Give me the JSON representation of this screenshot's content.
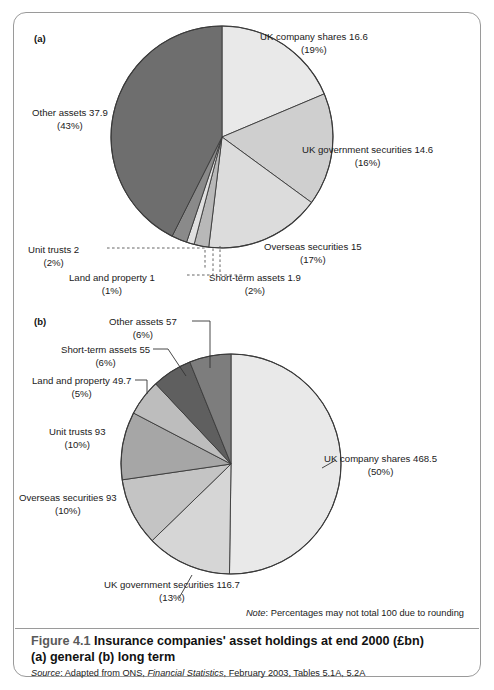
{
  "figure": {
    "panel_a_tag": "(a)",
    "panel_b_tag": "(b)",
    "note_word": "Note",
    "note_text": ": Percentages may not total 100 due to rounding",
    "caption_number": "Figure 4.1",
    "caption_title": "Insurance companies' asset holdings at end 2000 (£bn)",
    "caption_subtitle": "(a) general  (b) long term",
    "source_word": "Source",
    "source_text_1": ": Adapted from ONS, ",
    "source_publication": "Financial Statistics",
    "source_text_2": ", February 2003, Tables 5.1A, 5.2A"
  },
  "colors": {
    "shade_lightest": "#e9e9e9",
    "shade_light": "#dcdcdc",
    "shade_light_mid": "#cfcfcf",
    "shade_mid": "#b8b8b8",
    "shade_mid_dark": "#a6a6a6",
    "shade_dark": "#8a8a8a",
    "shade_darkest": "#6e6e6e",
    "outline": "#3a3a3a",
    "frame": "#9a9a9a",
    "text": "#1a1a1a"
  },
  "chart_data": [
    {
      "type": "pie",
      "id": "panel-a",
      "panel": "(a)",
      "title": "Insurance companies' asset holdings at end 2000 (£bn) (a) general",
      "unit": "£bn",
      "total": 89.0,
      "start_angle_deg": 0,
      "direction": "clockwise",
      "legend": "labels-with-leader-lines",
      "slices": [
        {
          "label": "UK company shares",
          "value": 16.6,
          "value_text": "16.6",
          "percent": 19,
          "percent_text": "(19%)",
          "color": "#e9e9e9"
        },
        {
          "label": "UK government securities",
          "value": 14.6,
          "value_text": "14.6",
          "percent": 16,
          "percent_text": "(16%)",
          "color": "#cfcfcf"
        },
        {
          "label": "Overseas securities",
          "value": 15,
          "value_text": "15",
          "percent": 17,
          "percent_text": "(17%)",
          "color": "#dcdcdc"
        },
        {
          "label": "Short-term assets",
          "value": 1.9,
          "value_text": "1.9",
          "percent": 2,
          "percent_text": "(2%)",
          "color": "#b8b8b8"
        },
        {
          "label": "Land and property",
          "value": 1,
          "value_text": "1",
          "percent": 1,
          "percent_text": "(1%)",
          "color": "#e0e0e0"
        },
        {
          "label": "Unit trusts",
          "value": 2,
          "value_text": "2",
          "percent": 2,
          "percent_text": "(2%)",
          "color": "#8a8a8a"
        },
        {
          "label": "Other assets",
          "value": 37.9,
          "value_text": "37.9",
          "percent": 43,
          "percent_text": "(43%)",
          "color": "#6e6e6e"
        }
      ]
    },
    {
      "type": "pie",
      "id": "panel-b",
      "panel": "(b)",
      "title": "Insurance companies' asset holdings at end 2000 (£bn) (b) long term",
      "unit": "£bn",
      "total": 932.9,
      "start_angle_deg": 0,
      "direction": "clockwise",
      "legend": "labels-with-leader-lines",
      "slices": [
        {
          "label": "UK company shares",
          "value": 468.5,
          "value_text": "468.5",
          "percent": 50,
          "percent_text": "(50%)",
          "color": "#e9e9e9"
        },
        {
          "label": "UK government securities",
          "value": 116.7,
          "value_text": "116.7",
          "percent": 13,
          "percent_text": "(13%)",
          "color": "#d6d6d6"
        },
        {
          "label": "Overseas securities",
          "value": 93,
          "value_text": "93",
          "percent": 10,
          "percent_text": "(10%)",
          "color": "#c4c4c4"
        },
        {
          "label": "Unit trusts",
          "value": 93,
          "value_text": "93",
          "percent": 10,
          "percent_text": "(10%)",
          "color": "#a6a6a6"
        },
        {
          "label": "Land and property",
          "value": 49.7,
          "value_text": "49.7",
          "percent": 5,
          "percent_text": "(5%)",
          "color": "#bdbdbd"
        },
        {
          "label": "Short-term assets",
          "value": 55,
          "value_text": "55",
          "percent": 6,
          "percent_text": "(6%)",
          "color": "#5f5f5f"
        },
        {
          "label": "Other assets",
          "value": 57,
          "value_text": "57",
          "percent": 6,
          "percent_text": "(6%)",
          "color": "#7d7d7d"
        }
      ]
    }
  ]
}
